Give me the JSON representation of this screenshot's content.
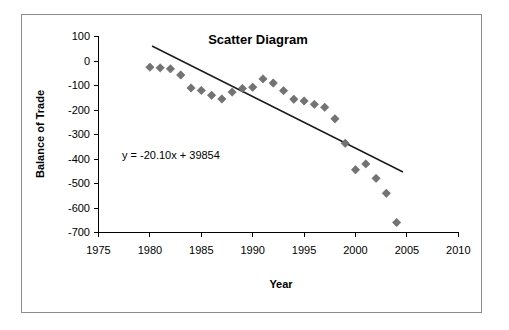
{
  "chart_data": {
    "type": "scatter",
    "title": "Scatter Diagram",
    "xlabel": "Year",
    "ylabel": "Balance of Trade",
    "xlim": [
      1975,
      2010
    ],
    "ylim": [
      -700,
      100
    ],
    "xticks": [
      1975,
      1980,
      1985,
      1990,
      1995,
      2000,
      2005,
      2010
    ],
    "yticks": [
      100,
      0,
      -100,
      -200,
      -300,
      -400,
      -500,
      -600,
      -700
    ],
    "grid": false,
    "legend": null,
    "marker_shape": "diamond",
    "marker_color": "#737373",
    "trendline": {
      "equation": "y = -20.10x + 39854",
      "slope": -20.1,
      "intercept": 39854,
      "color": "#1a1a1a",
      "x_start": 1980,
      "x_end": 2005
    },
    "x": [
      1980,
      1981,
      1982,
      1983,
      1984,
      1985,
      1986,
      1987,
      1988,
      1989,
      1990,
      1991,
      1992,
      1993,
      1994,
      1995,
      1996,
      1997,
      1998,
      1999,
      2000,
      2001,
      2002,
      2003,
      2004
    ],
    "y": [
      -25,
      -28,
      -32,
      -57,
      -110,
      -120,
      -140,
      -155,
      -127,
      -112,
      -107,
      -73,
      -90,
      -121,
      -156,
      -163,
      -177,
      -189,
      -236,
      -336,
      -444,
      -420,
      -479,
      -540,
      -659
    ],
    "points": [
      {
        "year": 1980,
        "value": -25
      },
      {
        "year": 1981,
        "value": -28
      },
      {
        "year": 1982,
        "value": -32
      },
      {
        "year": 1983,
        "value": -57
      },
      {
        "year": 1984,
        "value": -110
      },
      {
        "year": 1985,
        "value": -120
      },
      {
        "year": 1986,
        "value": -140
      },
      {
        "year": 1987,
        "value": -155
      },
      {
        "year": 1988,
        "value": -127
      },
      {
        "year": 1989,
        "value": -112
      },
      {
        "year": 1990,
        "value": -107
      },
      {
        "year": 1991,
        "value": -73
      },
      {
        "year": 1992,
        "value": -90
      },
      {
        "year": 1993,
        "value": -121
      },
      {
        "year": 1994,
        "value": -156
      },
      {
        "year": 1995,
        "value": -163
      },
      {
        "year": 1996,
        "value": -177
      },
      {
        "year": 1997,
        "value": -189
      },
      {
        "year": 1998,
        "value": -236
      },
      {
        "year": 1999,
        "value": -336
      },
      {
        "year": 2000,
        "value": -444
      },
      {
        "year": 2001,
        "value": -420
      },
      {
        "year": 2002,
        "value": -479
      },
      {
        "year": 2003,
        "value": -540
      },
      {
        "year": 2004,
        "value": -659
      }
    ]
  },
  "labels": {
    "tick_1975": "1975",
    "tick_1980": "1980",
    "tick_1985": "1985",
    "tick_1990": "1990",
    "tick_1995": "1995",
    "tick_2000": "2000",
    "tick_2005": "2005",
    "tick_2010": "2010",
    "y_100": "100",
    "y_0": "0",
    "y_m100": "-100",
    "y_m200": "-200",
    "y_m300": "-300",
    "y_m400": "-400",
    "y_m500": "-500",
    "y_m600": "-600",
    "y_m700": "-700"
  }
}
